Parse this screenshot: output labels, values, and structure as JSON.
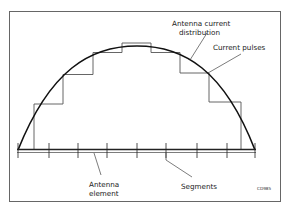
{
  "diagram": {
    "labels": {
      "distribution_line1": "Antenna current",
      "distribution_line2": "distribution",
      "pulses": "Current pulses",
      "element_line1": "Antenna",
      "element_line2": "element",
      "segments": "Segments",
      "figure_code": "CD985"
    },
    "colors": {
      "background": "#ffffff",
      "frame": "#555555",
      "curve": "#111111",
      "pulses": "#555555",
      "element": "#222222"
    },
    "segments_count": 8,
    "pulse_levels_relative": [
      0.0,
      0.48,
      0.77,
      0.99,
      1.1,
      0.99,
      0.81,
      0.5
    ]
  }
}
